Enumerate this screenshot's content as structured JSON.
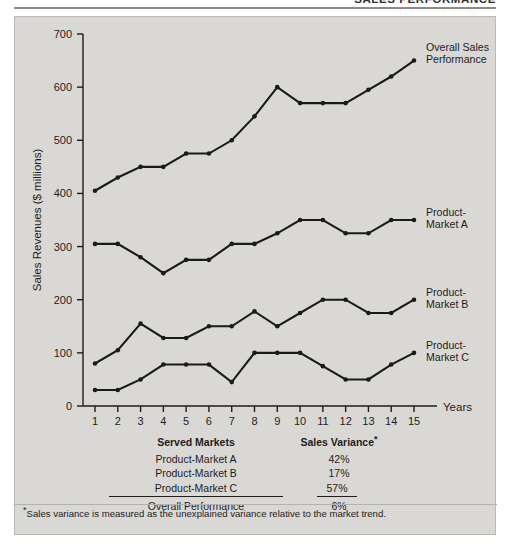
{
  "running_header": {
    "text": "SALES PERFORMANCE"
  },
  "chart_data": {
    "type": "line",
    "title": "",
    "xlabel": "Years",
    "ylabel": "Sales Revenues ($ millions)",
    "x": [
      1,
      2,
      3,
      4,
      5,
      6,
      7,
      8,
      9,
      10,
      11,
      12,
      13,
      14,
      15
    ],
    "xtick_labels": [
      "1",
      "2",
      "3",
      "4",
      "5",
      "6",
      "7",
      "8",
      "9",
      "10",
      "11",
      "12",
      "13",
      "14",
      "15"
    ],
    "ytick_labels": [
      "0",
      "100",
      "200",
      "300",
      "400",
      "500",
      "600",
      "700"
    ],
    "yticks": [
      0,
      100,
      200,
      300,
      400,
      500,
      600,
      700
    ],
    "ylim": [
      0,
      700
    ],
    "xlim": [
      1,
      15
    ],
    "grid": false,
    "legend_position": "right-inline-labels",
    "marker": "filled-circle",
    "line_color": "#1a1a1a",
    "series": [
      {
        "name": "Overall Sales Performance",
        "label_line_1": "Overall Sales",
        "label_line_2": "Performance",
        "values": [
          405,
          430,
          450,
          450,
          475,
          475,
          500,
          545,
          600,
          570,
          570,
          570,
          595,
          620,
          650
        ]
      },
      {
        "name": "Product-Market A",
        "label_line_1": "Product-",
        "label_line_2": "Market A",
        "values": [
          305,
          305,
          280,
          250,
          275,
          275,
          305,
          305,
          325,
          350,
          350,
          325,
          325,
          350,
          350
        ]
      },
      {
        "name": "Product-Market B",
        "label_line_1": "Product-",
        "label_line_2": "Market B",
        "values": [
          80,
          105,
          155,
          128,
          128,
          150,
          150,
          178,
          150,
          175,
          200,
          200,
          175,
          175,
          200
        ]
      },
      {
        "name": "Product-Market C",
        "label_line_1": "Product-",
        "label_line_2": "Market C",
        "values": [
          30,
          30,
          50,
          78,
          78,
          78,
          45,
          100,
          100,
          100,
          75,
          50,
          50,
          78,
          100
        ]
      }
    ]
  },
  "table": {
    "headers": {
      "col1": "Served Markets",
      "col2": "Sales Variance",
      "col2_star": "*"
    },
    "rows": [
      {
        "market": "Product-Market A",
        "variance": "42%"
      },
      {
        "market": "Product-Market B",
        "variance": "17%"
      },
      {
        "market": "Product-Market C",
        "variance": "57%"
      }
    ],
    "total_row": {
      "market": "Overall Performance",
      "variance": "6%"
    }
  },
  "footnote": {
    "star": "*",
    "text": "Sales variance is measured as the unexplained variance relative to the market trend."
  }
}
